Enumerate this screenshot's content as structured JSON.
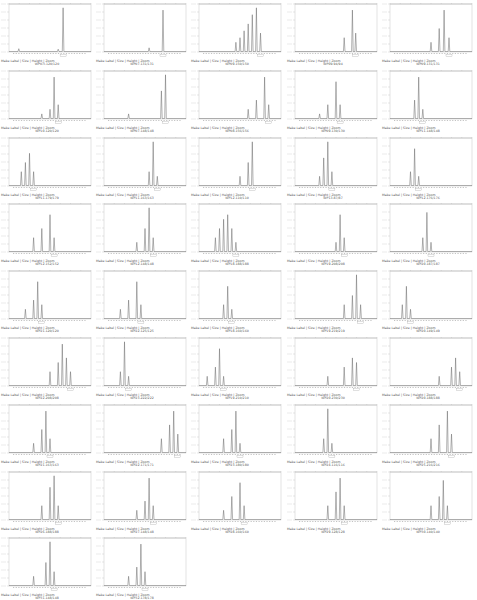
{
  "chart_data": {
    "type": "line",
    "title": "",
    "layout": {
      "columns": 5,
      "panel_count": 42,
      "grid": false
    },
    "controls_label": "Make Label | Size | Height | Zoom",
    "panels": [
      {
        "title": "WP07I.120/120",
        "peaks": [
          [
            0.12,
            0.06
          ],
          [
            0.6,
            0.05
          ],
          [
            0.66,
            0.95
          ]
        ]
      },
      {
        "title": "WP07.131/131",
        "peaks": [
          [
            0.55,
            0.08
          ],
          [
            0.72,
            0.9
          ]
        ]
      },
      {
        "title": "WP09.150/150",
        "peaks": [
          [
            0.45,
            0.2
          ],
          [
            0.5,
            0.3
          ],
          [
            0.55,
            0.45
          ],
          [
            0.6,
            0.6
          ],
          [
            0.65,
            0.8
          ],
          [
            0.7,
            0.95
          ],
          [
            0.75,
            0.4
          ]
        ]
      },
      {
        "title": "WP09.94/94",
        "peaks": [
          [
            0.6,
            0.3
          ],
          [
            0.7,
            0.9
          ],
          [
            0.74,
            0.4
          ]
        ]
      },
      {
        "title": "WP09.131/131",
        "peaks": [
          [
            0.5,
            0.2
          ],
          [
            0.6,
            0.5
          ],
          [
            0.66,
            0.9
          ],
          [
            0.72,
            0.3
          ]
        ]
      },
      {
        "title": "WP10.120/120",
        "peaks": [
          [
            0.4,
            0.1
          ],
          [
            0.5,
            0.2
          ],
          [
            0.55,
            0.9
          ],
          [
            0.6,
            0.3
          ]
        ]
      },
      {
        "title": "WP07.148/148",
        "peaks": [
          [
            0.3,
            0.1
          ],
          [
            0.7,
            0.6
          ],
          [
            0.75,
            0.95
          ]
        ]
      },
      {
        "title": "WP08.156/156",
        "peaks": [
          [
            0.6,
            0.2
          ],
          [
            0.7,
            0.4
          ],
          [
            0.8,
            0.9
          ],
          [
            0.85,
            0.3
          ]
        ]
      },
      {
        "title": "WP09.130/130",
        "peaks": [
          [
            0.3,
            0.1
          ],
          [
            0.4,
            0.3
          ],
          [
            0.5,
            0.8
          ],
          [
            0.55,
            0.3
          ]
        ]
      },
      {
        "title": "WP11.148/148",
        "peaks": [
          [
            0.3,
            0.4
          ],
          [
            0.35,
            0.9
          ],
          [
            0.4,
            0.2
          ]
        ]
      },
      {
        "title": "WP11.179/179",
        "peaks": [
          [
            0.15,
            0.3
          ],
          [
            0.2,
            0.5
          ],
          [
            0.25,
            0.7
          ],
          [
            0.3,
            0.3
          ]
        ]
      },
      {
        "title": "WP11.163/163",
        "peaks": [
          [
            0.55,
            0.3
          ],
          [
            0.6,
            0.95
          ],
          [
            0.65,
            0.2
          ]
        ]
      },
      {
        "title": "WP12.110/110",
        "peaks": [
          [
            0.5,
            0.2
          ],
          [
            0.6,
            0.5
          ],
          [
            0.65,
            0.95
          ]
        ]
      },
      {
        "title": "WP13.87/87",
        "peaks": [
          [
            0.3,
            0.2
          ],
          [
            0.35,
            0.6
          ],
          [
            0.4,
            0.95
          ],
          [
            0.45,
            0.3
          ]
        ]
      },
      {
        "title": "WP12.176/176",
        "peaks": [
          [
            0.25,
            0.3
          ],
          [
            0.3,
            0.8
          ],
          [
            0.35,
            0.2
          ]
        ]
      },
      {
        "title": "WP12.152/152",
        "peaks": [
          [
            0.3,
            0.3
          ],
          [
            0.4,
            0.5
          ],
          [
            0.5,
            0.8
          ],
          [
            0.55,
            0.3
          ]
        ]
      },
      {
        "title": "WP12.148/148",
        "peaks": [
          [
            0.4,
            0.2
          ],
          [
            0.5,
            0.5
          ],
          [
            0.55,
            0.95
          ],
          [
            0.6,
            0.3
          ]
        ]
      },
      {
        "title": "WP18.188/188",
        "peaks": [
          [
            0.2,
            0.3
          ],
          [
            0.25,
            0.5
          ],
          [
            0.3,
            0.7
          ],
          [
            0.35,
            0.8
          ],
          [
            0.4,
            0.5
          ],
          [
            0.45,
            0.2
          ]
        ]
      },
      {
        "title": "WP19.208/208",
        "peaks": [
          [
            0.5,
            0.2
          ],
          [
            0.55,
            0.8
          ],
          [
            0.6,
            0.3
          ]
        ]
      },
      {
        "title": "WP20.187/187",
        "peaks": [
          [
            0.4,
            0.3
          ],
          [
            0.45,
            0.85
          ],
          [
            0.5,
            0.2
          ]
        ]
      },
      {
        "title": "WP21.120/120",
        "peaks": [
          [
            0.2,
            0.2
          ],
          [
            0.3,
            0.4
          ],
          [
            0.35,
            0.8
          ],
          [
            0.4,
            0.3
          ]
        ]
      },
      {
        "title": "WP22.125/125",
        "peaks": [
          [
            0.2,
            0.2
          ],
          [
            0.3,
            0.4
          ],
          [
            0.4,
            0.8
          ],
          [
            0.45,
            0.3
          ]
        ]
      },
      {
        "title": "WP18.160/160",
        "peaks": [
          [
            0.3,
            0.3
          ],
          [
            0.35,
            0.7
          ],
          [
            0.4,
            0.2
          ]
        ]
      },
      {
        "title": "WP19.219/219",
        "peaks": [
          [
            0.6,
            0.3
          ],
          [
            0.7,
            0.5
          ],
          [
            0.75,
            0.95
          ],
          [
            0.8,
            0.3
          ]
        ]
      },
      {
        "title": "WP20.149/149",
        "peaks": [
          [
            0.15,
            0.3
          ],
          [
            0.2,
            0.7
          ],
          [
            0.25,
            0.2
          ]
        ]
      },
      {
        "title": "WP22.208/208",
        "peaks": [
          [
            0.5,
            0.3
          ],
          [
            0.6,
            0.5
          ],
          [
            0.65,
            0.9
          ],
          [
            0.7,
            0.6
          ],
          [
            0.75,
            0.3
          ]
        ]
      },
      {
        "title": "WP23.222/222",
        "peaks": [
          [
            0.2,
            0.3
          ],
          [
            0.25,
            0.95
          ],
          [
            0.3,
            0.2
          ]
        ]
      },
      {
        "title": "WP19.210/210",
        "peaks": [
          [
            0.1,
            0.2
          ],
          [
            0.2,
            0.4
          ],
          [
            0.25,
            0.8
          ],
          [
            0.3,
            0.2
          ]
        ]
      },
      {
        "title": "WP20.230/230",
        "peaks": [
          [
            0.4,
            0.2
          ],
          [
            0.6,
            0.4
          ],
          [
            0.7,
            0.6
          ],
          [
            0.75,
            0.5
          ]
        ]
      },
      {
        "title": "WP20.188/188",
        "peaks": [
          [
            0.6,
            0.2
          ],
          [
            0.75,
            0.4
          ],
          [
            0.8,
            0.6
          ],
          [
            0.85,
            0.3
          ]
        ]
      },
      {
        "title": "WP21.163/163",
        "peaks": [
          [
            0.3,
            0.2
          ],
          [
            0.4,
            0.5
          ],
          [
            0.45,
            0.9
          ],
          [
            0.5,
            0.3
          ]
        ]
      },
      {
        "title": "WP22.171/171",
        "peaks": [
          [
            0.7,
            0.3
          ],
          [
            0.8,
            0.6
          ],
          [
            0.85,
            0.9
          ],
          [
            0.9,
            0.4
          ]
        ]
      },
      {
        "title": "WP23.180/180",
        "peaks": [
          [
            0.3,
            0.3
          ],
          [
            0.4,
            0.5
          ],
          [
            0.45,
            0.9
          ],
          [
            0.5,
            0.2
          ]
        ]
      },
      {
        "title": "WP24.116/116",
        "peaks": [
          [
            0.35,
            0.3
          ],
          [
            0.4,
            0.95
          ],
          [
            0.45,
            0.2
          ]
        ]
      },
      {
        "title": "WP25.216/216",
        "peaks": [
          [
            0.5,
            0.3
          ],
          [
            0.6,
            0.6
          ],
          [
            0.7,
            0.9
          ],
          [
            0.75,
            0.4
          ]
        ]
      },
      {
        "title": "WP26.188/188",
        "peaks": [
          [
            0.4,
            0.3
          ],
          [
            0.5,
            0.7
          ],
          [
            0.55,
            0.95
          ],
          [
            0.6,
            0.3
          ]
        ]
      },
      {
        "title": "WP27.148/148",
        "peaks": [
          [
            0.4,
            0.2
          ],
          [
            0.5,
            0.4
          ],
          [
            0.55,
            0.9
          ],
          [
            0.6,
            0.3
          ]
        ]
      },
      {
        "title": "WP28.160/160",
        "peaks": [
          [
            0.3,
            0.2
          ],
          [
            0.4,
            0.5
          ],
          [
            0.5,
            0.8
          ],
          [
            0.55,
            0.3
          ]
        ]
      },
      {
        "title": "WP29.128/128",
        "peaks": [
          [
            0.4,
            0.3
          ],
          [
            0.5,
            0.6
          ],
          [
            0.55,
            0.9
          ],
          [
            0.6,
            0.3
          ]
        ]
      },
      {
        "title": "WP30.140/140",
        "peaks": [
          [
            0.5,
            0.3
          ],
          [
            0.6,
            0.5
          ],
          [
            0.65,
            0.85
          ],
          [
            0.7,
            0.3
          ]
        ]
      },
      {
        "title": "WP31.148/148",
        "peaks": [
          [
            0.3,
            0.2
          ],
          [
            0.45,
            0.5
          ],
          [
            0.5,
            0.95
          ],
          [
            0.55,
            0.3
          ]
        ]
      },
      {
        "title": "WP32.178/178",
        "peaks": [
          [
            0.3,
            0.2
          ],
          [
            0.4,
            0.4
          ],
          [
            0.45,
            0.9
          ],
          [
            0.5,
            0.3
          ]
        ]
      }
    ],
    "xlabel": "",
    "ylabel": ""
  }
}
